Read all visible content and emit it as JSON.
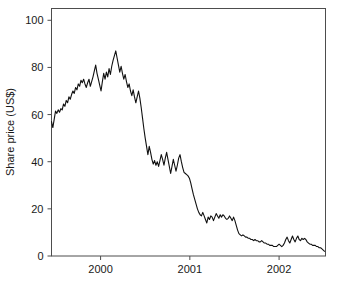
{
  "chart_data": {
    "type": "line",
    "title": "",
    "xlabel": "",
    "ylabel": "Share price (US$)",
    "ylim": [
      0,
      105
    ],
    "xlim": [
      1999.45,
      2002.52
    ],
    "grid": false,
    "legend": false,
    "y_ticks": [
      0,
      20,
      40,
      60,
      80,
      100
    ],
    "y_tick_labels": [
      "0",
      "20",
      "40",
      "60",
      "80",
      "100"
    ],
    "x_ticks": [
      2000,
      2001,
      2002
    ],
    "x_tick_labels": [
      "2000",
      "2001",
      "2002"
    ],
    "series": [
      {
        "name": "Share price",
        "color": "#111111",
        "x": [
          1999.45,
          1999.465,
          1999.48,
          1999.495,
          1999.51,
          1999.525,
          1999.54,
          1999.555,
          1999.57,
          1999.585,
          1999.6,
          1999.615,
          1999.63,
          1999.645,
          1999.66,
          1999.675,
          1999.69,
          1999.705,
          1999.72,
          1999.735,
          1999.75,
          1999.765,
          1999.78,
          1999.795,
          1999.81,
          1999.825,
          1999.84,
          1999.855,
          1999.87,
          1999.885,
          1999.9,
          1999.915,
          1999.93,
          1999.945,
          1999.96,
          1999.975,
          1999.99,
          2000.005,
          2000.02,
          2000.035,
          2000.05,
          2000.065,
          2000.08,
          2000.095,
          2000.11,
          2000.125,
          2000.14,
          2000.155,
          2000.17,
          2000.185,
          2000.2,
          2000.215,
          2000.23,
          2000.245,
          2000.26,
          2000.275,
          2000.29,
          2000.305,
          2000.32,
          2000.335,
          2000.35,
          2000.365,
          2000.38,
          2000.395,
          2000.41,
          2000.425,
          2000.44,
          2000.455,
          2000.47,
          2000.485,
          2000.5,
          2000.515,
          2000.53,
          2000.545,
          2000.56,
          2000.575,
          2000.59,
          2000.605,
          2000.62,
          2000.635,
          2000.65,
          2000.665,
          2000.68,
          2000.695,
          2000.71,
          2000.725,
          2000.74,
          2000.755,
          2000.77,
          2000.785,
          2000.8,
          2000.815,
          2000.83,
          2000.845,
          2000.86,
          2000.875,
          2000.89,
          2000.905,
          2000.92,
          2000.935,
          2000.95,
          2000.965,
          2000.98,
          2000.995,
          2001.01,
          2001.025,
          2001.04,
          2001.055,
          2001.07,
          2001.085,
          2001.1,
          2001.115,
          2001.13,
          2001.145,
          2001.16,
          2001.175,
          2001.19,
          2001.205,
          2001.22,
          2001.235,
          2001.25,
          2001.265,
          2001.28,
          2001.295,
          2001.31,
          2001.325,
          2001.34,
          2001.355,
          2001.37,
          2001.385,
          2001.4,
          2001.415,
          2001.43,
          2001.445,
          2001.46,
          2001.475,
          2001.49,
          2001.505,
          2001.52,
          2001.535,
          2001.55,
          2001.565,
          2001.58,
          2001.595,
          2001.61,
          2001.625,
          2001.64,
          2001.655,
          2001.67,
          2001.685,
          2001.7,
          2001.715,
          2001.73,
          2001.745,
          2001.76,
          2001.775,
          2001.79,
          2001.805,
          2001.82,
          2001.835,
          2001.85,
          2001.865,
          2001.88,
          2001.895,
          2001.91,
          2001.925,
          2001.94,
          2001.955,
          2001.97,
          2001.985,
          2002.0,
          2002.015,
          2002.03,
          2002.045,
          2002.06,
          2002.075,
          2002.09,
          2002.105,
          2002.12,
          2002.135,
          2002.15,
          2002.165,
          2002.18,
          2002.195,
          2002.21,
          2002.225,
          2002.24,
          2002.255,
          2002.27,
          2002.285,
          2002.3,
          2002.315,
          2002.33,
          2002.345,
          2002.36,
          2002.375,
          2002.39,
          2002.405,
          2002.42,
          2002.435,
          2002.45,
          2002.465,
          2002.48,
          2002.495,
          2002.51
        ],
        "y": [
          57.0,
          54.5,
          58.0,
          61.5,
          60.5,
          62.0,
          61.0,
          62.5,
          62.0,
          64.5,
          63.5,
          66.0,
          65.0,
          67.5,
          66.5,
          68.5,
          70.0,
          69.0,
          71.5,
          70.5,
          73.0,
          72.0,
          74.5,
          73.5,
          75.0,
          73.0,
          71.5,
          73.5,
          75.0,
          72.0,
          74.0,
          76.0,
          78.5,
          81.0,
          77.5,
          75.0,
          72.5,
          70.0,
          74.0,
          77.5,
          75.0,
          78.0,
          76.0,
          79.5,
          77.0,
          80.5,
          83.0,
          85.0,
          87.0,
          84.0,
          81.0,
          78.0,
          80.5,
          77.5,
          75.0,
          77.0,
          74.0,
          71.5,
          73.0,
          70.0,
          68.0,
          70.5,
          67.5,
          65.0,
          67.5,
          70.0,
          67.0,
          63.0,
          58.5,
          54.0,
          50.0,
          46.5,
          43.0,
          46.5,
          44.0,
          41.0,
          39.0,
          40.5,
          38.5,
          40.0,
          38.0,
          40.5,
          43.0,
          41.0,
          38.5,
          41.5,
          44.0,
          41.0,
          38.0,
          35.0,
          38.0,
          41.0,
          38.5,
          36.0,
          38.5,
          41.5,
          43.0,
          40.0,
          37.5,
          35.5,
          35.0,
          34.5,
          34.0,
          33.0,
          31.0,
          28.5,
          26.0,
          24.0,
          22.0,
          20.0,
          18.5,
          17.5,
          17.0,
          18.5,
          17.0,
          15.5,
          14.0,
          16.5,
          15.5,
          17.0,
          16.5,
          15.0,
          16.5,
          18.0,
          17.0,
          16.0,
          17.5,
          16.5,
          17.5,
          17.0,
          16.0,
          15.5,
          16.0,
          17.0,
          16.0,
          15.0,
          16.5,
          15.0,
          13.0,
          11.0,
          9.5,
          9.0,
          8.5,
          9.0,
          8.5,
          8.0,
          8.0,
          7.5,
          7.5,
          7.0,
          7.0,
          6.5,
          7.0,
          6.5,
          6.5,
          6.0,
          6.0,
          6.5,
          6.0,
          5.5,
          5.5,
          5.0,
          5.0,
          4.5,
          4.5,
          4.5,
          4.0,
          4.0,
          4.0,
          4.5,
          5.0,
          4.5,
          4.0,
          4.5,
          5.5,
          7.0,
          8.0,
          6.5,
          5.5,
          7.0,
          8.5,
          7.0,
          6.0,
          7.5,
          8.5,
          7.0,
          6.5,
          7.5,
          7.0,
          7.5,
          7.0,
          6.0,
          5.5,
          5.0,
          5.0,
          4.5,
          4.5,
          4.5,
          4.0,
          4.0,
          3.5,
          3.5,
          3.0,
          2.5,
          2.0
        ]
      }
    ]
  }
}
